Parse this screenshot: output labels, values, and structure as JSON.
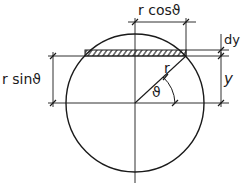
{
  "diagram": {
    "labels": {
      "r_cos": "r cosϑ",
      "r_sin": "r sinϑ",
      "dy": "dy",
      "y": "y",
      "r": "r",
      "theta": "ϑ"
    },
    "colors": {
      "stroke": "#1a1a1a",
      "background": "#ffffff"
    }
  }
}
